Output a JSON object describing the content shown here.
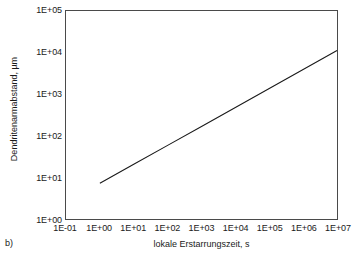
{
  "figure": {
    "panel_label": "b)",
    "background_color": "#ffffff",
    "frame_color": "#4a4a4a",
    "line_color": "#1a1a1a"
  },
  "chart_data": {
    "type": "line",
    "title": "",
    "subtitle": "",
    "xlabel": "lokale Erstarrungszeit, s",
    "ylabel": "Dendritenarmabstand, µm",
    "xscale": "log",
    "yscale": "log",
    "xlim": [
      0.1,
      10000000
    ],
    "ylim": [
      1,
      100000
    ],
    "grid": false,
    "legend": null,
    "legend_position": "none",
    "xticklabels": [
      "1E-01",
      "1E+00",
      "1E+01",
      "1E+02",
      "1E+03",
      "1E+04",
      "1E+05",
      "1E+06",
      "1E+07"
    ],
    "xtickvalues": [
      0.1,
      1,
      10,
      100,
      1000,
      10000,
      100000,
      1000000,
      10000000
    ],
    "yticklabels": [
      "1E+00",
      "1E+01",
      "1E+02",
      "1E+03",
      "1E+04",
      "1E+05"
    ],
    "ytickvalues": [
      1,
      10,
      100,
      1000,
      10000,
      100000
    ],
    "series": [
      {
        "name": "Dendritenarmabstand",
        "x": [
          1,
          10,
          100,
          1000,
          10000,
          100000,
          1000000,
          10000000
        ],
        "y": [
          7.2,
          20.6,
          58.9,
          168,
          480,
          1373,
          3925,
          11220
        ],
        "color": "#1a1a1a",
        "width": 1.1,
        "style": "solid"
      }
    ],
    "annotations": []
  }
}
